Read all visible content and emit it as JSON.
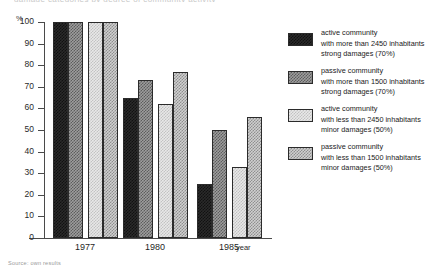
{
  "top_clipped_text": "damage categories by degree of community activity",
  "axis": {
    "y_unit": "%",
    "x_title": "year",
    "y_ticks": [
      100,
      90,
      80,
      70,
      60,
      50,
      40,
      30,
      20,
      10,
      0
    ],
    "x_categories": [
      "1977",
      "1980",
      "1985"
    ]
  },
  "legend": {
    "items": [
      {
        "swatch": "solid-dark",
        "line1": "active community",
        "line2": "with more than 2450 inhabitants",
        "line3": "strong  damages  (70%)"
      },
      {
        "swatch": "medium-checker",
        "line1": "passive community",
        "line2": "with more than 1500 inhabitants",
        "line3": "strong  damages  (70%)"
      },
      {
        "swatch": "light-checker",
        "line1": "active community",
        "line2": "with less than 2450 inhabitants",
        "line3": "minor  damages  (50%)"
      },
      {
        "swatch": "medium-light-checker",
        "line1": "passive community",
        "line2": "with less than 1500 inhabitants",
        "line3": "minor  damages  (50%)"
      }
    ]
  },
  "source_note": "Source: own results",
  "chart_data": {
    "type": "bar",
    "title": "",
    "xlabel": "year",
    "ylabel": "%",
    "ylim": [
      0,
      100
    ],
    "grid": false,
    "legend_position": "right",
    "categories": [
      "1977",
      "1980",
      "1985"
    ],
    "series": [
      {
        "name": "active community with more than 2450 inhabitants, strong damages (70%)",
        "pattern": "solid-dark",
        "values": [
          100,
          65,
          25
        ]
      },
      {
        "name": "passive community with more than 1500 inhabitants, strong damages (70%)",
        "pattern": "medium-checker",
        "values": [
          100,
          73,
          50
        ]
      },
      {
        "name": "active community with less than 2450 inhabitants, minor damages (50%)",
        "pattern": "light-checker",
        "values": [
          100,
          62,
          33
        ]
      },
      {
        "name": "passive community with less than 1500 inhabitants, minor damages (50%)",
        "pattern": "medium-light-checker",
        "values": [
          100,
          77,
          56
        ]
      }
    ]
  }
}
